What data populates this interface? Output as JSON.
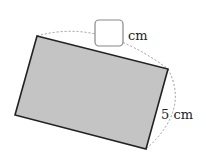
{
  "diagram": {
    "shape": "rectangle (rotated, shaded)",
    "fill_color": "#c4c4c4",
    "stroke_color": "#222222",
    "vertices": {
      "top_left": [
        37,
        36
      ],
      "top_right": [
        168,
        69
      ],
      "bottom_right": [
        146,
        149
      ],
      "bottom_left": [
        15,
        115
      ]
    },
    "labels": {
      "length_unit": "cm",
      "width_label": "5 cm"
    },
    "answer_box": {
      "value": ""
    }
  }
}
